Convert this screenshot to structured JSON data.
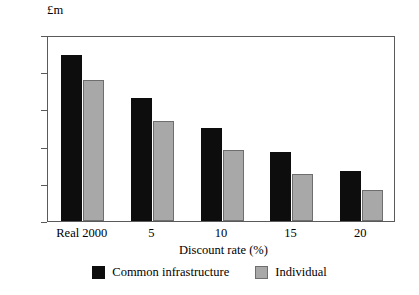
{
  "chart_data": {
    "type": "bar",
    "title": "",
    "subtitle": "",
    "xlabel": "Discount rate (%)",
    "ylabel": "£m",
    "ylabel_position": "top-left",
    "categories": [
      "Real 2000",
      "5",
      "10",
      "15",
      "20"
    ],
    "series": [
      {
        "name": "Common infrastructure",
        "color": "#0d0d0d",
        "values": [
          447,
          330,
          250,
          185,
          135
        ]
      },
      {
        "name": "Individual",
        "color": "#a8a8a8",
        "values": [
          380,
          268,
          192,
          127,
          83
        ]
      }
    ],
    "ylim": [
      0,
      500
    ],
    "yticks": [
      0,
      100,
      200,
      300,
      400,
      500
    ],
    "ytick_labels": [
      "0",
      "100",
      "200",
      "300",
      "400",
      "500"
    ],
    "grid": false,
    "legend_position": "bottom-center",
    "frame": "full-box"
  }
}
